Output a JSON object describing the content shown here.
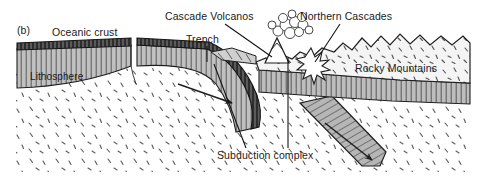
{
  "figure": {
    "panel_label": "(b)",
    "caption_title": "Subduction zone cross section",
    "background_color": "#ffffff",
    "ink_color": "#1a1a1a"
  },
  "labels": {
    "oceanic_crust": "Oceanic crust",
    "lithosphere": "Lithosphere",
    "trench": "Trench",
    "cascade_volcanos": "Cascade Volcanos",
    "northern_cascades": "Northern Cascades",
    "rocky_mountains": "Rocky Mountains",
    "subduction_complex": "Subduction complex"
  },
  "colors": {
    "oceanic_crust_fill": "#4a4a4a",
    "lithosphere_fill": "#b9b9b9",
    "continental_crust_fill": "#f2f2f2",
    "slab_fill": "#b4b4b4",
    "asthenosphere_fill": "#ffffff",
    "outline": "#1a1a1a",
    "plume_fill": "#ffffff"
  },
  "features": [
    {
      "name": "oceanic-crust-left",
      "kind": "layer"
    },
    {
      "name": "oceanic-lithosphere-left",
      "kind": "layer"
    },
    {
      "name": "spreading-ridge-gap",
      "kind": "boundary"
    },
    {
      "name": "oceanic-crust-right",
      "kind": "layer"
    },
    {
      "name": "subducting-slab",
      "kind": "slab"
    },
    {
      "name": "detached-slab",
      "kind": "slab"
    },
    {
      "name": "asthenosphere",
      "kind": "mantle"
    },
    {
      "name": "continental-crust",
      "kind": "layer"
    },
    {
      "name": "continental-lithosphere",
      "kind": "layer"
    },
    {
      "name": "volcano-cone",
      "kind": "volcano"
    },
    {
      "name": "ash-plume",
      "kind": "plume"
    },
    {
      "name": "magma-burst",
      "kind": "burst"
    }
  ]
}
